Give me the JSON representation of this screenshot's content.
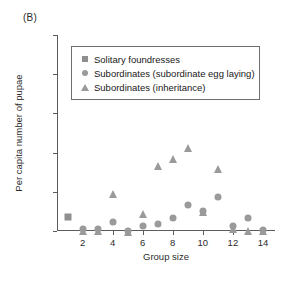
{
  "panel": {
    "label": "(B)"
  },
  "chart_data": {
    "type": "scatter",
    "title": "",
    "xlabel": "Group size",
    "ylabel": "Per capita number of pupae",
    "xlim": [
      0.3,
      14.8
    ],
    "ylim": [
      0.0,
      2.5
    ],
    "xticks": [
      2,
      4,
      6,
      8,
      10,
      12,
      14
    ],
    "yticks": [
      0.0,
      0.5,
      1.0,
      1.5,
      2.0,
      2.5
    ],
    "ytick_labels": [
      "0.0",
      "0.5",
      "1.0",
      "1.5",
      "2.0",
      "2.5"
    ],
    "xtick_labels": [
      "2",
      "4",
      "6",
      "8",
      "10",
      "12",
      "14"
    ],
    "grid": false,
    "legend_position": "upper-center",
    "marker_color": "#9a9a9a",
    "axis_color": "#5c5c5c",
    "series": [
      {
        "name": "Solitary foundresses",
        "marker": "square",
        "points": [
          {
            "x": 1,
            "y": 0.18
          }
        ]
      },
      {
        "name": "Subordinates (subordinate egg laying)",
        "marker": "circle",
        "points": [
          {
            "x": 2,
            "y": 0.03
          },
          {
            "x": 3,
            "y": 0.02
          },
          {
            "x": 4,
            "y": 0.12
          },
          {
            "x": 5,
            "y": 0.0
          },
          {
            "x": 6,
            "y": 0.06
          },
          {
            "x": 7,
            "y": 0.09
          },
          {
            "x": 8,
            "y": 0.16
          },
          {
            "x": 9,
            "y": 0.33
          },
          {
            "x": 10,
            "y": 0.26
          },
          {
            "x": 11,
            "y": 0.43
          },
          {
            "x": 12,
            "y": 0.06
          },
          {
            "x": 13,
            "y": 0.16
          },
          {
            "x": 14,
            "y": 0.01
          }
        ]
      },
      {
        "name": "Subordinates (inheritance)",
        "marker": "triangle",
        "points": [
          {
            "x": 2,
            "y": 0.02
          },
          {
            "x": 3,
            "y": 0.02
          },
          {
            "x": 4,
            "y": 0.49
          },
          {
            "x": 5,
            "y": 0.0
          },
          {
            "x": 6,
            "y": 0.23
          },
          {
            "x": 7,
            "y": 0.85
          },
          {
            "x": 8,
            "y": 0.94
          },
          {
            "x": 9,
            "y": 1.08
          },
          {
            "x": 10,
            "y": 0.26
          },
          {
            "x": 11,
            "y": 0.81
          },
          {
            "x": 12,
            "y": 0.04
          },
          {
            "x": 13,
            "y": 0.02
          },
          {
            "x": 14,
            "y": 0.01
          }
        ]
      }
    ]
  },
  "legend": {
    "items": [
      {
        "label": "Solitary foundresses",
        "marker": "square"
      },
      {
        "label": "Subordinates (subordinate egg laying)",
        "marker": "circle"
      },
      {
        "label": "Subordinates (inheritance)",
        "marker": "triangle"
      }
    ]
  }
}
